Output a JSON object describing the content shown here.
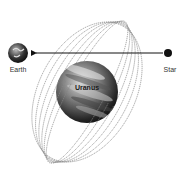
{
  "diagram": {
    "nodes": {
      "earth": {
        "label": "Earth",
        "cx": 18,
        "cy": 53,
        "r": 10
      },
      "star": {
        "label": "Star",
        "cx": 168,
        "cy": 53,
        "r": 4
      },
      "uranus": {
        "label": "Uranus",
        "cx": 87,
        "cy": 92,
        "r": 31
      }
    },
    "arrow": {
      "from": "star",
      "to": "earth",
      "direction": "left"
    },
    "rings": {
      "count": 6,
      "center": [
        87,
        92
      ],
      "tilt_deg": 28,
      "major_radius": 80,
      "minor_radii": [
        18,
        24,
        30,
        36,
        42,
        48
      ]
    },
    "colors": {
      "background": "#ffffff",
      "line": "#111111",
      "ring": "#888888",
      "planet_dark": "#1a1a1a",
      "planet_light": "#d8d8d8"
    }
  }
}
